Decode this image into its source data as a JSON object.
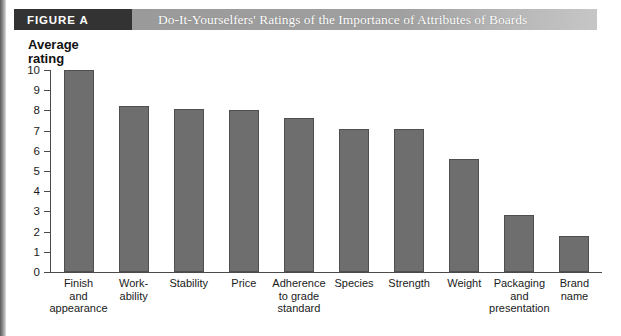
{
  "banner": {
    "tag": "FIGURE  A",
    "title": "Do-It-Yourselfers' Ratings of the Importance of Attributes of Boards"
  },
  "colors": {
    "bar_fill": "#6e6e6e",
    "bar_stroke": "#4f4f4f",
    "axis": "#4a4a4a",
    "tag_bg": "#333333",
    "banner_bg": "#a0a0a0"
  },
  "chart_data": {
    "type": "bar",
    "title": "Do-It-Yourselfers' Ratings of the Importance of Attributes of Boards",
    "xlabel": "",
    "ylabel": "Average\nrating",
    "ylim": [
      0,
      10
    ],
    "yticks": [
      10,
      9,
      8,
      7,
      6,
      5,
      4,
      3,
      2,
      1,
      0
    ],
    "grid": false,
    "legend": false,
    "categories": [
      "Finish\nand\nappearance",
      "Work-\nability",
      "Stability",
      "Price",
      "Adherence\nto grade\nstandard",
      "Species",
      "Strength",
      "Weight",
      "Packaging\nand\npresentation",
      "Brand\nname"
    ],
    "values": [
      10.0,
      8.2,
      8.05,
      8.0,
      7.6,
      7.1,
      7.1,
      5.6,
      2.8,
      1.8
    ]
  }
}
